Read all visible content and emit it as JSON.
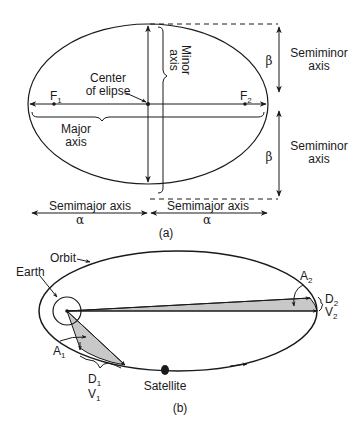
{
  "figure_a": {
    "caption": "(a)",
    "labels": {
      "minor_axis_line1": "Minor",
      "minor_axis_line2": "axis",
      "center_line1": "Center",
      "center_line2": "of elipse",
      "major_axis_line1": "Major",
      "major_axis_line2": "axis",
      "focus1": "F",
      "focus1_sub": "1",
      "focus2": "F",
      "focus2_sub": "2",
      "semiminor_top_line1": "Semiminor",
      "semiminor_top_line2": "axis",
      "semiminor_bottom_line1": "Semiminor",
      "semiminor_bottom_line2": "axis",
      "beta_top": "β",
      "beta_bottom": "β",
      "semimajor_left": "Semimajor axis",
      "semimajor_right": "Semimajor axis",
      "alpha_left": "α",
      "alpha_right": "α"
    }
  },
  "figure_b": {
    "caption": "(b)",
    "labels": {
      "orbit": "Orbit",
      "earth": "Earth",
      "a1": "A",
      "a1_sub": "1",
      "d1": "D",
      "d1_sub": "1",
      "v1": "V",
      "v1_sub": "1",
      "a2": "A",
      "a2_sub": "2",
      "d2": "D",
      "d2_sub": "2",
      "v2": "V",
      "v2_sub": "2",
      "satellite": "Satellite"
    },
    "colors": {
      "swept_area_fill": "#c8c8c8",
      "line": "#1a1a1a"
    }
  }
}
